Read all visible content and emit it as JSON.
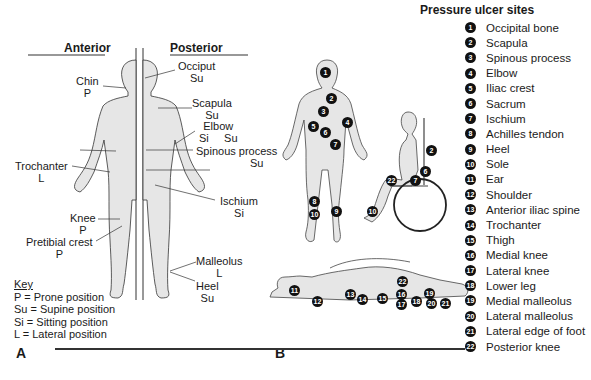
{
  "figure_a": {
    "header_anterior": "Anterior",
    "header_posterior": "Posterior",
    "labels": [
      {
        "name": "Chin",
        "code": "P"
      },
      {
        "name": "Occiput",
        "code": "Su"
      },
      {
        "name": "Scapula",
        "code": "Su"
      },
      {
        "name": "Elbow",
        "code": "Si     Su"
      },
      {
        "name": "Spinous process",
        "code": "Su"
      },
      {
        "name": "Trochanter",
        "code": "L"
      },
      {
        "name": "Ischium",
        "code": "Si"
      },
      {
        "name": "Knee",
        "code": "P"
      },
      {
        "name": "Pretibial crest",
        "code": "P"
      },
      {
        "name": "Malleolus",
        "code": "L"
      },
      {
        "name": "Heel",
        "code": "Su"
      }
    ],
    "key": {
      "title": "Key",
      "items": [
        "P = Prone position",
        "Su = Supine position",
        "Si = Sitting position",
        "L = Lateral position"
      ]
    },
    "panel_label": "A"
  },
  "figure_b": {
    "panel_label": "B",
    "legend_title": "Pressure ulcer sites",
    "sites": [
      {
        "n": "1",
        "label": "Occipital bone"
      },
      {
        "n": "2",
        "label": "Scapula"
      },
      {
        "n": "3",
        "label": "Spinous process"
      },
      {
        "n": "4",
        "label": "Elbow"
      },
      {
        "n": "5",
        "label": "Iliac crest"
      },
      {
        "n": "6",
        "label": "Sacrum"
      },
      {
        "n": "7",
        "label": "Ischium"
      },
      {
        "n": "8",
        "label": "Achilles tendon"
      },
      {
        "n": "9",
        "label": "Heel"
      },
      {
        "n": "10",
        "label": "Sole"
      },
      {
        "n": "11",
        "label": "Ear"
      },
      {
        "n": "12",
        "label": "Shoulder"
      },
      {
        "n": "13",
        "label": "Anterior iliac spine"
      },
      {
        "n": "14",
        "label": "Trochanter"
      },
      {
        "n": "15",
        "label": "Thigh"
      },
      {
        "n": "16",
        "label": "Medial knee"
      },
      {
        "n": "17",
        "label": "Lateral knee"
      },
      {
        "n": "18",
        "label": "Lower leg"
      },
      {
        "n": "19",
        "label": "Medial malleolus"
      },
      {
        "n": "20",
        "label": "Lateral malleolus"
      },
      {
        "n": "21",
        "label": "Lateral edge of foot"
      },
      {
        "n": "22",
        "label": "Posterior knee"
      }
    ],
    "markers_standing": [
      "1",
      "2",
      "3",
      "4",
      "5",
      "6",
      "7",
      "8",
      "9",
      "10"
    ],
    "markers_sitting": [
      "2",
      "6",
      "7",
      "22",
      "10"
    ],
    "markers_lying": [
      "11",
      "12",
      "13",
      "14",
      "15",
      "16",
      "17",
      "18",
      "19",
      "20",
      "21",
      "22"
    ]
  }
}
